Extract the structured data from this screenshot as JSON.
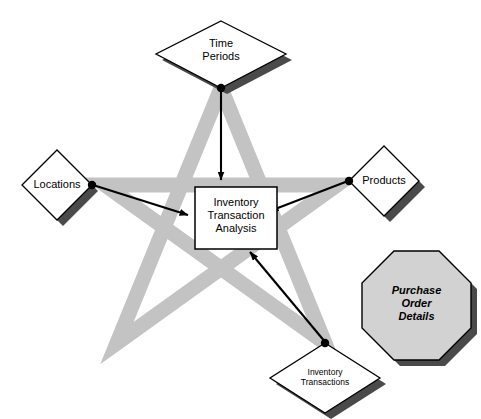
{
  "diagram": {
    "colors": {
      "star_fill": "#c3c3c3",
      "shape_fill": "#ffffff",
      "octagon_fill": "#d2d2d2",
      "outline": "#000000",
      "shadow": "#4a4a4a",
      "background": "#ffffff"
    },
    "center": {
      "shape": "rectangle",
      "label": "Inventory\nTransaction\nAnalysis",
      "label_lines": [
        "Inventory",
        "Transaction",
        "Analysis"
      ]
    },
    "dimensions": [
      {
        "id": "time-periods",
        "shape": "diamond",
        "label": "Time\nPeriods",
        "label_lines": [
          "Time",
          "Periods"
        ],
        "position": "top",
        "connector": "arrow-to-center",
        "has_endpoint_dot": true
      },
      {
        "id": "locations",
        "shape": "diamond",
        "label": "Locations",
        "label_lines": [
          "Locations"
        ],
        "position": "left",
        "connector": "arrow-to-center",
        "has_endpoint_dot": true
      },
      {
        "id": "products",
        "shape": "diamond",
        "label": "Products",
        "label_lines": [
          "Products"
        ],
        "position": "right",
        "connector": "arrow-to-center",
        "has_endpoint_dot": true
      },
      {
        "id": "inventory-transactions",
        "shape": "diamond",
        "label": "Inventory\nTransactions",
        "label_lines": [
          "Inventory",
          "Transactions"
        ],
        "position": "bottom-right",
        "connector": "arrow-to-center",
        "has_endpoint_dot": true
      }
    ],
    "detached": [
      {
        "id": "purchase-order-details",
        "shape": "octagon",
        "label": "Purchase\nOrder\nDetails",
        "label_lines": [
          "Purchase",
          "Order",
          "Details"
        ],
        "position": "right-lower",
        "connector": "none"
      }
    ],
    "star": {
      "shape": "five-pointed-star-outline",
      "points": 5,
      "filled": false
    }
  }
}
